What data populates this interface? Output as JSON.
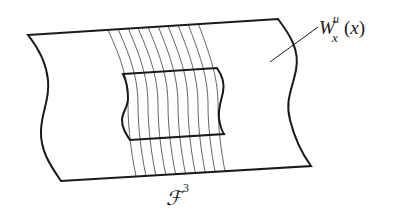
{
  "figure": {
    "type": "diagram",
    "labels": {
      "unstable_manifold": {
        "base": "W",
        "superscript": "u",
        "subscript": "x",
        "argument_open": "(",
        "argument": "x",
        "argument_close": ")"
      },
      "foliation": {
        "base": "ℱ",
        "superscript": "3"
      }
    },
    "leaf_count": 10,
    "colors": {
      "outline": "#1a1a1a",
      "leaves": "#555555",
      "background": "#ffffff"
    }
  }
}
